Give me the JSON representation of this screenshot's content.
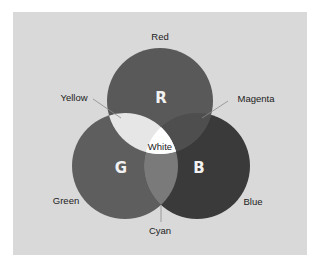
{
  "diagram": {
    "type": "venn",
    "circles": [
      {
        "id": "red",
        "letter": "R",
        "label": "Red",
        "cx": 160,
        "cy": 101,
        "r": 53,
        "fill": "#595959"
      },
      {
        "id": "green",
        "letter": "G",
        "label": "Green",
        "cx": 125,
        "cy": 166,
        "r": 53,
        "fill": "#5e5e5e"
      },
      {
        "id": "blue",
        "letter": "B",
        "label": "Blue",
        "cx": 197,
        "cy": 166,
        "r": 53,
        "fill": "#3a3a3a"
      }
    ],
    "overlaps": {
      "yellow": {
        "label": "Yellow",
        "between": [
          "red",
          "green"
        ],
        "fill": "#e6e6e6"
      },
      "magenta": {
        "label": "Magenta",
        "between": [
          "red",
          "blue"
        ],
        "fill": "#4e4e4e"
      },
      "cyan": {
        "label": "Cyan",
        "between": [
          "green",
          "blue"
        ],
        "fill": "#7a7a7a"
      },
      "white": {
        "label": "White",
        "between": [
          "red",
          "green",
          "blue"
        ],
        "fill": "#ffffff"
      }
    },
    "background": "#d9d9d9"
  }
}
